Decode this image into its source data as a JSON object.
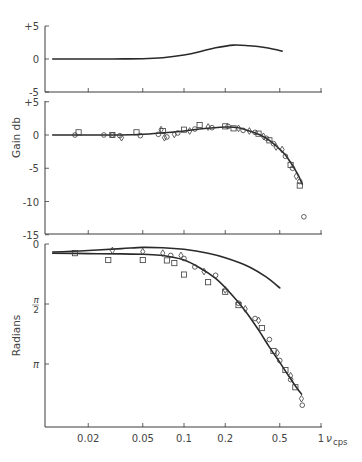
{
  "figure": {
    "x_axis": {
      "label": "ν",
      "unit": "cps",
      "ticks": [
        {
          "value": 0.02,
          "label": "0.02"
        },
        {
          "value": 0.05,
          "label": "0.05"
        },
        {
          "value": 0.1,
          "label": "0.1"
        },
        {
          "value": 0.2,
          "label": "0.2"
        },
        {
          "value": 0.5,
          "label": "0.5"
        },
        {
          "value": 1,
          "label": "1"
        }
      ]
    },
    "panels": {
      "top": {
        "ylabel": "",
        "ticks": [
          {
            "value": 5,
            "label": "+5"
          },
          {
            "value": 0,
            "label": "0"
          },
          {
            "value": -5,
            "label": "-5"
          }
        ]
      },
      "gain": {
        "ylabel": "Gain db",
        "ticks": [
          {
            "value": 5,
            "label": "+5"
          },
          {
            "value": 0,
            "label": "0"
          },
          {
            "value": -5,
            "label": "-5"
          },
          {
            "value": -10,
            "label": "-10"
          },
          {
            "value": -15,
            "label": "-15"
          }
        ]
      },
      "phase": {
        "ylabel": "Radians",
        "ticks": [
          {
            "value": 0,
            "label": "0"
          },
          {
            "value": 1.5708,
            "label": "π/2"
          },
          {
            "value": 3.1416,
            "label": "π"
          }
        ]
      }
    }
  },
  "chart_data": [
    {
      "type": "line",
      "title": "Gain difference (top panel)",
      "xlabel": "ν cps",
      "ylabel": "db",
      "xscale": "log",
      "xlim": [
        0.01,
        1.0
      ],
      "ylim": [
        -5,
        5
      ],
      "grid": false,
      "series": [
        {
          "name": "curve",
          "x": [
            0.011,
            0.02,
            0.03,
            0.05,
            0.07,
            0.1,
            0.13,
            0.17,
            0.23,
            0.3,
            0.4,
            0.52
          ],
          "y": [
            0.0,
            0.0,
            0.0,
            0.05,
            0.2,
            0.6,
            1.1,
            1.7,
            2.1,
            2.0,
            1.7,
            1.2
          ]
        }
      ]
    },
    {
      "type": "scatter",
      "title": "Gain (middle panel)",
      "xlabel": "ν cps",
      "ylabel": "Gain db",
      "xscale": "log",
      "xlim": [
        0.01,
        1.0
      ],
      "ylim": [
        -15,
        5
      ],
      "grid": false,
      "series": [
        {
          "name": "fitted curve",
          "kind": "line",
          "x": [
            0.011,
            0.02,
            0.034,
            0.05,
            0.067,
            0.1,
            0.13,
            0.2,
            0.25,
            0.3,
            0.36,
            0.42,
            0.48,
            0.55,
            0.62,
            0.68,
            0.73
          ],
          "y": [
            0.0,
            0.0,
            0.0,
            0.1,
            0.3,
            0.6,
            0.9,
            1.2,
            1.1,
            0.6,
            0.0,
            -0.8,
            -1.8,
            -3.0,
            -4.6,
            -6.0,
            -7.4
          ]
        },
        {
          "name": "measured (circle)",
          "marker": "circle",
          "x": [
            0.016,
            0.026,
            0.03,
            0.034,
            0.048,
            0.065,
            0.075,
            0.09,
            0.12,
            0.16,
            0.21,
            0.27,
            0.33,
            0.4,
            0.45,
            0.55,
            0.62,
            0.7,
            0.75
          ],
          "y": [
            0.0,
            0.0,
            0.0,
            -0.1,
            -0.1,
            0.1,
            -0.3,
            0.3,
            0.9,
            1.1,
            1.3,
            0.7,
            0.4,
            -0.5,
            -1.3,
            -3.2,
            -5.0,
            -7.0,
            -12.3
          ]
        },
        {
          "name": "measured (square)",
          "marker": "square",
          "x": [
            0.017,
            0.03,
            0.045,
            0.07,
            0.1,
            0.13,
            0.2,
            0.23,
            0.35,
            0.42,
            0.6,
            0.7
          ],
          "y": [
            0.4,
            0.0,
            0.4,
            0.6,
            0.8,
            1.5,
            1.3,
            1.0,
            0.2,
            -0.8,
            -4.5,
            -7.6
          ]
        },
        {
          "name": "measured (triangle/diamond)",
          "marker": "diamond",
          "x": [
            0.035,
            0.068,
            0.072,
            0.085,
            0.11,
            0.15,
            0.25,
            0.3,
            0.38,
            0.47,
            0.52,
            0.66
          ],
          "y": [
            -0.4,
            0.8,
            -0.4,
            0.1,
            0.6,
            1.2,
            1.0,
            0.6,
            -0.2,
            -1.8,
            -2.2,
            -6.2
          ]
        }
      ]
    },
    {
      "type": "scatter",
      "title": "Phase (bottom panel)",
      "xlabel": "ν cps",
      "ylabel": "Radians",
      "xscale": "log",
      "xlim": [
        0.01,
        1.0
      ],
      "ylim": [
        0,
        4.8
      ],
      "y_inverted": true,
      "grid": false,
      "series": [
        {
          "name": "upper curve",
          "kind": "line",
          "x": [
            0.011,
            0.02,
            0.035,
            0.05,
            0.07,
            0.1,
            0.15,
            0.2,
            0.3,
            0.4,
            0.5
          ],
          "y": [
            0.21,
            0.17,
            0.12,
            0.09,
            0.1,
            0.14,
            0.24,
            0.36,
            0.6,
            0.87,
            1.15
          ]
        },
        {
          "name": "lower fitted curve",
          "kind": "line",
          "x": [
            0.011,
            0.02,
            0.035,
            0.05,
            0.07,
            0.1,
            0.13,
            0.17,
            0.22,
            0.28,
            0.35,
            0.42,
            0.5,
            0.58,
            0.66,
            0.72
          ],
          "y": [
            0.24,
            0.25,
            0.26,
            0.27,
            0.3,
            0.42,
            0.62,
            0.9,
            1.3,
            1.75,
            2.25,
            2.7,
            3.1,
            3.45,
            3.75,
            3.93
          ]
        },
        {
          "name": "measured (circle)",
          "marker": "circle",
          "x": [
            0.08,
            0.1,
            0.12,
            0.17,
            0.25,
            0.33,
            0.42,
            0.5,
            0.6,
            0.73
          ],
          "y": [
            0.3,
            0.38,
            0.6,
            0.82,
            1.55,
            1.95,
            2.5,
            3.05,
            3.55,
            4.22
          ]
        },
        {
          "name": "measured (square)",
          "marker": "square",
          "x": [
            0.016,
            0.028,
            0.05,
            0.075,
            0.085,
            0.1,
            0.15,
            0.2,
            0.25,
            0.37,
            0.45,
            0.55,
            0.65
          ],
          "y": [
            0.24,
            0.42,
            0.42,
            0.43,
            0.5,
            0.8,
            1.0,
            1.25,
            1.6,
            2.2,
            2.8,
            3.3,
            3.75
          ]
        },
        {
          "name": "measured (triangle/diamond)",
          "marker": "diamond",
          "x": [
            0.03,
            0.05,
            0.07,
            0.095,
            0.14,
            0.2,
            0.28,
            0.35,
            0.48,
            0.6,
            0.72
          ],
          "y": [
            0.17,
            0.2,
            0.24,
            0.3,
            0.72,
            1.2,
            1.7,
            2.0,
            2.85,
            3.45,
            4.05
          ]
        }
      ]
    }
  ]
}
